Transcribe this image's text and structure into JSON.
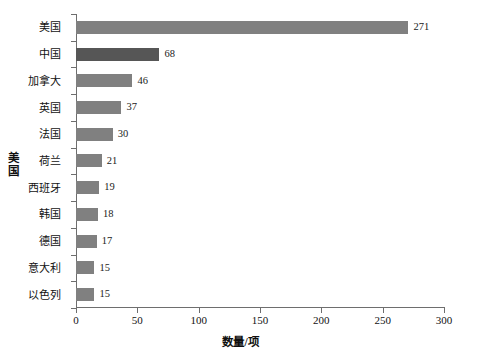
{
  "chart_data": {
    "type": "bar",
    "orientation": "horizontal",
    "title": "",
    "xlabel": "数量/项",
    "ylabel": "美国",
    "categories": [
      "美国",
      "中国",
      "加拿大",
      "英国",
      "法国",
      "荷兰",
      "西班牙",
      "韩国",
      "德国",
      "意大利",
      "以色列"
    ],
    "values": [
      271,
      68,
      46,
      37,
      30,
      21,
      19,
      18,
      17,
      15,
      15
    ],
    "value_labels": [
      "271",
      "68",
      "46",
      "37",
      "30",
      "21",
      "19",
      "18",
      "17",
      "15",
      "15"
    ],
    "xlim": [
      0,
      300
    ],
    "xticks": [
      0,
      50,
      100,
      150,
      200,
      250,
      300
    ],
    "xtick_labels": [
      "0",
      "50",
      "100",
      "150",
      "200",
      "250",
      "300"
    ],
    "grid": false,
    "legend": null,
    "bar_color": "#808080",
    "highlight_color": "#565656",
    "highlighted_categories": [
      "中国"
    ],
    "axis_color": "#6e6e6e",
    "background": "#ffffff",
    "text_color": "#121212"
  }
}
